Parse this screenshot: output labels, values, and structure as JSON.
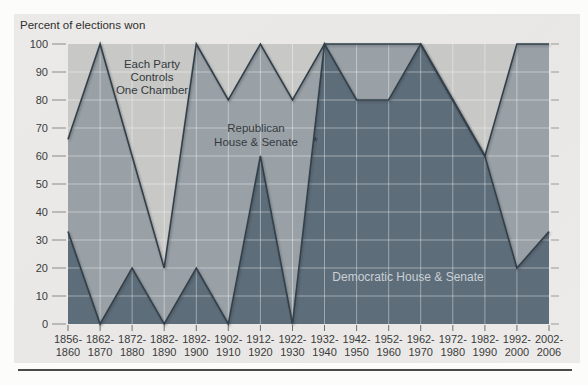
{
  "figure": {
    "note_marker": "*"
  },
  "chart_data": {
    "type": "area",
    "stacked": true,
    "title": "Percent of elections won",
    "xlabel": "",
    "ylabel": "Percent of elections won",
    "ylim": [
      0,
      100
    ],
    "yticks": [
      0,
      10,
      20,
      30,
      40,
      50,
      60,
      70,
      80,
      90,
      100
    ],
    "grid": true,
    "legend_position": "labels-inside-areas",
    "categories": [
      "1856-1860",
      "1862-1870",
      "1872-1880",
      "1882-1890",
      "1892-1900",
      "1902-1910",
      "1912-1920",
      "1922-1930",
      "1932-1940",
      "1942-1950",
      "1952-1960",
      "1962-1970",
      "1972-1980",
      "1982-1990",
      "1992-2000",
      "2002-2006"
    ],
    "series": [
      {
        "name": "Democratic House & Senate",
        "color": "#5e6d7a",
        "values": [
          33,
          0,
          20,
          0,
          20,
          0,
          60,
          0,
          100,
          80,
          80,
          100,
          80,
          60,
          20,
          33
        ]
      },
      {
        "name": "Republican House & Senate",
        "color": "#9aa1a6",
        "values": [
          33,
          100,
          40,
          20,
          80,
          80,
          40,
          80,
          0,
          20,
          20,
          0,
          0,
          0,
          80,
          67
        ]
      },
      {
        "name": "Each Party Controls One Chamber",
        "color": "#c8c8c6",
        "values": [
          34,
          0,
          40,
          80,
          0,
          20,
          0,
          20,
          0,
          0,
          0,
          0,
          20,
          40,
          0,
          0
        ]
      }
    ],
    "labels": {
      "split": [
        "Each Party",
        "Controls",
        "One Chamber"
      ],
      "republican": [
        "Republican",
        "House & Senate"
      ],
      "democratic": "Democratic House & Senate"
    },
    "style_colors": {
      "boundary_line": "#333f49",
      "gridline": "#ffffff"
    }
  }
}
